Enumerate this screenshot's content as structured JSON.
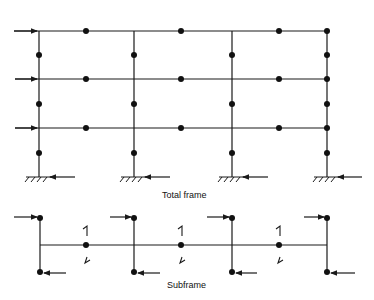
{
  "diagram": {
    "total_frame": {
      "label": "Total frame",
      "columns_x": [
        39,
        134,
        232,
        327
      ],
      "beams_y": [
        31,
        79,
        128
      ],
      "base_y": 177,
      "beam_start_x": 14,
      "midspan_dots_x": [
        86,
        181,
        279
      ],
      "column_dots_y": [
        55,
        104,
        153
      ]
    },
    "subframe": {
      "label": "Subframe",
      "beam_y": 245,
      "columns_x": [
        40,
        134,
        232,
        327
      ],
      "column_top_y": 218,
      "column_bottom_y": 272,
      "midspan_dots_x": [
        86,
        181,
        279
      ],
      "midspan_top_mark": "1",
      "midspan_bottom_mark": "l"
    },
    "colors": {
      "line": "#1a1a1a",
      "background": "#ffffff"
    }
  }
}
